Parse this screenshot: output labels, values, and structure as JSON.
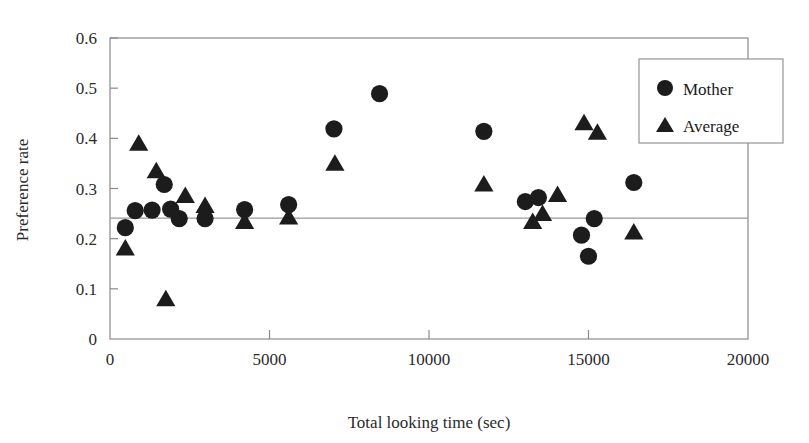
{
  "chart_data": {
    "type": "scatter",
    "title": "",
    "xlabel": "Total looking time (sec)",
    "ylabel": "Preference rate",
    "xlim": [
      0,
      20000
    ],
    "ylim": [
      0,
      0.6
    ],
    "xticks": [
      "0",
      "5000",
      "10000",
      "15000",
      "20000"
    ],
    "xtick_values": [
      0,
      5000,
      10000,
      15000,
      20000
    ],
    "yticks": [
      "0",
      "0.1",
      "0.2",
      "0.3",
      "0.4",
      "0.5",
      "0.6"
    ],
    "ytick_values": [
      0,
      0.1,
      0.2,
      0.3,
      0.4,
      0.5,
      0.6
    ],
    "grid": false,
    "legend_position": "top-right",
    "reference_line": {
      "orientation": "horizontal",
      "y": 0.241,
      "label": ""
    },
    "series": [
      {
        "name": "Mother",
        "marker": "circle",
        "color": "#1c1c1c",
        "points": [
          {
            "x": 480,
            "y": 0.222
          },
          {
            "x": 790,
            "y": 0.256
          },
          {
            "x": 1320,
            "y": 0.257
          },
          {
            "x": 1700,
            "y": 0.308
          },
          {
            "x": 1900,
            "y": 0.259
          },
          {
            "x": 2170,
            "y": 0.24
          },
          {
            "x": 2980,
            "y": 0.24
          },
          {
            "x": 4220,
            "y": 0.258
          },
          {
            "x": 5600,
            "y": 0.268
          },
          {
            "x": 7020,
            "y": 0.419
          },
          {
            "x": 8450,
            "y": 0.489
          },
          {
            "x": 11720,
            "y": 0.414
          },
          {
            "x": 13020,
            "y": 0.274
          },
          {
            "x": 13430,
            "y": 0.282
          },
          {
            "x": 14780,
            "y": 0.207
          },
          {
            "x": 15000,
            "y": 0.165
          },
          {
            "x": 15180,
            "y": 0.24
          },
          {
            "x": 16420,
            "y": 0.312
          }
        ]
      },
      {
        "name": "Average",
        "marker": "triangle",
        "color": "#1c1c1c",
        "points": [
          {
            "x": 480,
            "y": 0.181
          },
          {
            "x": 900,
            "y": 0.39
          },
          {
            "x": 1450,
            "y": 0.335
          },
          {
            "x": 1750,
            "y": 0.08
          },
          {
            "x": 2360,
            "y": 0.286
          },
          {
            "x": 2980,
            "y": 0.266
          },
          {
            "x": 4220,
            "y": 0.234
          },
          {
            "x": 5600,
            "y": 0.243
          },
          {
            "x": 7050,
            "y": 0.35
          },
          {
            "x": 11720,
            "y": 0.309
          },
          {
            "x": 13250,
            "y": 0.234
          },
          {
            "x": 13560,
            "y": 0.25
          },
          {
            "x": 14030,
            "y": 0.288
          },
          {
            "x": 14860,
            "y": 0.431
          },
          {
            "x": 15280,
            "y": 0.412
          },
          {
            "x": 16420,
            "y": 0.213
          }
        ]
      }
    ]
  },
  "legend": {
    "items": [
      {
        "label": "Mother",
        "marker": "circle"
      },
      {
        "label": "Average",
        "marker": "triangle"
      }
    ]
  }
}
